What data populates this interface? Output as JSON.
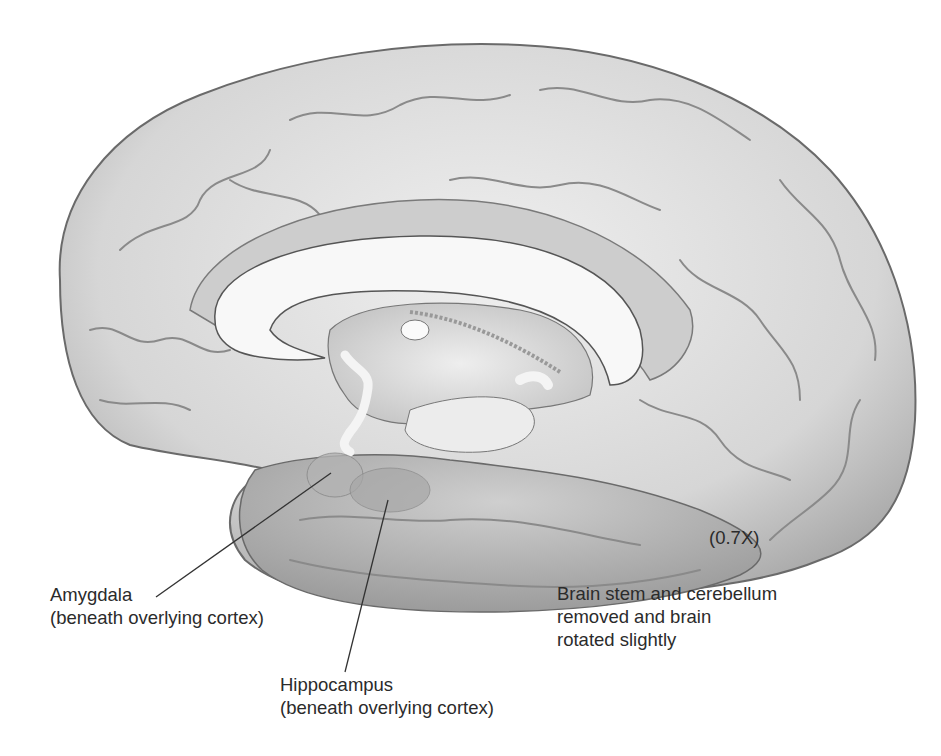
{
  "figure": {
    "colors": {
      "background": "#ffffff",
      "cortex": "#d9d9d9",
      "white_matter": "#f7f7f7",
      "outline": "#6a6a6a",
      "text": "#2b2b2b"
    }
  },
  "labels": {
    "amygdala": {
      "name": "Amygdala",
      "note": "(beneath overlying cortex)"
    },
    "hippocampus": {
      "name": "Hippocampus",
      "note": "(beneath overlying cortex)"
    }
  },
  "scale": "(0.7X)",
  "caption": {
    "line1": "Brain stem and cerebellum",
    "line2": "removed and brain",
    "line3": "rotated slightly"
  }
}
